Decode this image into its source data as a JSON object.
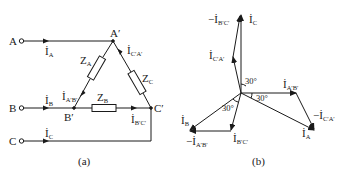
{
  "figure": {
    "panel_a": {
      "caption": "(a)",
      "terminals": [
        {
          "label": "A",
          "current": "İ",
          "current_sub": "A"
        },
        {
          "label": "B",
          "current": "İ",
          "current_sub": "B"
        },
        {
          "label": "C",
          "current": "İ",
          "current_sub": "C"
        }
      ],
      "nodes": [
        {
          "label": "A′"
        },
        {
          "label": "B′"
        },
        {
          "label": "C′"
        }
      ],
      "impedances": [
        {
          "label": "Z",
          "sub": "A"
        },
        {
          "label": "Z",
          "sub": "B"
        },
        {
          "label": "Z",
          "sub": "C"
        }
      ],
      "branch_currents": [
        {
          "label": "İ",
          "sub": "A′B′"
        },
        {
          "label": "İ",
          "sub": "B′C′"
        },
        {
          "label": "İ",
          "sub": "C′A′"
        }
      ]
    },
    "panel_b": {
      "caption": "(b)",
      "phasors": [
        {
          "label": "İ",
          "sub": "C",
          "prefix": ""
        },
        {
          "label": "İ",
          "sub": "B′C′",
          "prefix": "−"
        },
        {
          "label": "İ",
          "sub": "C′A′",
          "prefix": ""
        },
        {
          "label": "İ",
          "sub": "A′B′",
          "prefix": ""
        },
        {
          "label": "İ",
          "sub": "C′A′",
          "prefix": "−"
        },
        {
          "label": "İ",
          "sub": "A",
          "prefix": ""
        },
        {
          "label": "İ",
          "sub": "B",
          "prefix": ""
        },
        {
          "label": "İ",
          "sub": "A′B′",
          "prefix": "−"
        },
        {
          "label": "İ",
          "sub": "B′C′",
          "prefix": ""
        }
      ],
      "angles": [
        "30°",
        "30°",
        "30°"
      ]
    }
  }
}
